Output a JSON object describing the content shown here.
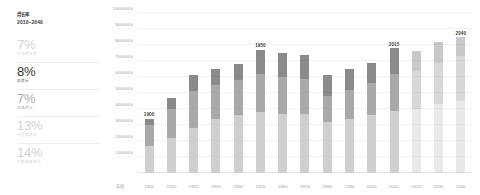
{
  "sidebar": {
    "header": {
      "title": "增长率",
      "range": "2010–2040"
    },
    "stats": [
      {
        "value": "7%",
        "caption": "年均增长率"
      },
      {
        "value": "8%",
        "caption": "总增长"
      },
      {
        "value": "7%",
        "caption": "城镇增长"
      },
      {
        "value": "13%",
        "caption": "中国总增长"
      },
      {
        "value": "14%",
        "caption": "中部地区增长"
      }
    ]
  },
  "chart_data": {
    "type": "bar",
    "title": "",
    "subtitle": "",
    "xlabel": "年份",
    "ylabel": "",
    "ylim": [
      0,
      10000000
    ],
    "grid": true,
    "legend_position": "none",
    "stacked": true,
    "categories": [
      "1900",
      "1910",
      "1920",
      "1930",
      "1940",
      "1950",
      "1960",
      "1970",
      "1980",
      "1990",
      "2000",
      "2010",
      "2020",
      "2030",
      "2040"
    ],
    "ytick_labels": [
      "1000000",
      "2000000",
      "3000000",
      "4000000",
      "5000000",
      "6000000",
      "7000000",
      "8000000",
      "9000000",
      "10000000"
    ],
    "yticks": [
      1000000,
      2000000,
      3000000,
      4000000,
      5000000,
      6000000,
      7000000,
      8000000,
      9000000,
      10000000
    ],
    "series": [
      {
        "name": "底层",
        "color": "#cfcfcf",
        "values": [
          1700000,
          2200000,
          2800000,
          3400000,
          3600000,
          3800000,
          3700000,
          3700000,
          3200000,
          3400000,
          3600000,
          3900000,
          4000000,
          4300000,
          4500000
        ]
      },
      {
        "name": "中层",
        "color": "#a9a9a9",
        "values": [
          1300000,
          1800000,
          2300000,
          2100000,
          2200000,
          2400000,
          2300000,
          2200000,
          1600000,
          1800000,
          2000000,
          2300000,
          2400000,
          2600000,
          2800000
        ]
      },
      {
        "name": "顶层",
        "color": "#8a8a8a",
        "values": [
          400000,
          700000,
          1000000,
          1000000,
          1000000,
          1500000,
          1500000,
          1500000,
          1300000,
          1300000,
          1300000,
          1600000,
          1200000,
          1300000,
          1200000
        ]
      }
    ],
    "totals": [
      3400000,
      4700000,
      6100000,
      6500000,
      6800000,
      7700000,
      7500000,
      7400000,
      6100000,
      6500000,
      6900000,
      7800000,
      7600000,
      8200000,
      8500000
    ],
    "annotations": [
      {
        "category": "1900",
        "label": "1900"
      },
      {
        "category": "1950",
        "label": "1950"
      },
      {
        "category": "2010",
        "label": "2015"
      },
      {
        "category": "2040",
        "label": "2040"
      }
    ],
    "projection_from": "2020"
  }
}
